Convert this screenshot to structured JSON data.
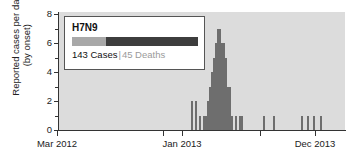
{
  "chart_data": {
    "type": "bar",
    "title": "",
    "xlabel": "",
    "ylabel": "Reported cases per day (by onset)",
    "ylabel_line1": "Reported cases per day",
    "ylabel_line2": "(by onset)",
    "ylim": [
      0,
      8
    ],
    "y_ticks": [
      0,
      2,
      4,
      6,
      8
    ],
    "y_minor_ticks": [
      1,
      3,
      5,
      7
    ],
    "grid": false,
    "legend_position": "top-left-inset",
    "x_range_label_start": "Mar 2012",
    "x_range_label_mid": "Jan 2013",
    "x_range_label_end": "Dec 2013",
    "x_tick_labels": [
      "Mar 2012",
      "Jan 2013",
      "Dec 2013"
    ],
    "x_tick_positions_px": [
      57,
      182,
      315
    ],
    "x_extra_tick_positions_px": [
      163,
      260
    ],
    "bar_color": "#6e6e6e",
    "plot_background": "#dcdcdc",
    "note": "Daily H7N9 case counts by onset date, Mar 2012 - Dec 2013",
    "bars": [
      {
        "x_px": 133,
        "value": 2
      },
      {
        "x_px": 137,
        "value": 2
      },
      {
        "x_px": 141,
        "value": 1
      },
      {
        "x_px": 145,
        "value": 1
      },
      {
        "x_px": 147,
        "value": 1
      },
      {
        "x_px": 149,
        "value": 2
      },
      {
        "x_px": 151,
        "value": 3
      },
      {
        "x_px": 153,
        "value": 4
      },
      {
        "x_px": 155,
        "value": 5
      },
      {
        "x_px": 157,
        "value": 6
      },
      {
        "x_px": 159,
        "value": 7
      },
      {
        "x_px": 161,
        "value": 7
      },
      {
        "x_px": 163,
        "value": 6
      },
      {
        "x_px": 165,
        "value": 6
      },
      {
        "x_px": 167,
        "value": 5
      },
      {
        "x_px": 169,
        "value": 3
      },
      {
        "x_px": 171,
        "value": 3
      },
      {
        "x_px": 173,
        "value": 1
      },
      {
        "x_px": 177,
        "value": 1
      },
      {
        "x_px": 181,
        "value": 1
      },
      {
        "x_px": 183,
        "value": 1
      },
      {
        "x_px": 205,
        "value": 1
      },
      {
        "x_px": 215,
        "value": 1
      },
      {
        "x_px": 243,
        "value": 1
      },
      {
        "x_px": 249,
        "value": 1
      },
      {
        "x_px": 255,
        "value": 1
      },
      {
        "x_px": 262,
        "value": 1
      }
    ]
  },
  "legend": {
    "title": "H7N9",
    "cases_label": "143 Cases",
    "separator": "|",
    "deaths_label": "45 Deaths",
    "cases_value": 143,
    "deaths_value": 45,
    "swatch_light_color": "#a8a8a8",
    "swatch_dark_color": "#3d3d3d",
    "swatch_light_fraction": 0.27
  }
}
